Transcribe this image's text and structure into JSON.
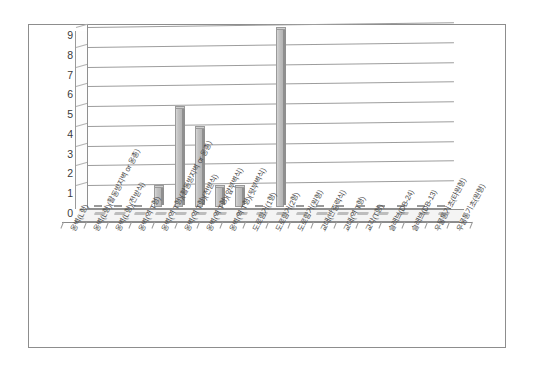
{
  "chart_data": {
    "type": "bar",
    "title": "",
    "xlabel": "",
    "ylabel": "",
    "ylim": [
      0,
      9
    ],
    "ytick_step": 1,
    "grid": true,
    "legend": "none",
    "style": "3d-column",
    "yticks": [
      "9",
      "8",
      "7",
      "6",
      "5",
      "4",
      "3",
      "2",
      "1",
      "0"
    ],
    "categories": [
      "옹벽(L형)",
      "옹벽(L형)(활동방지벽 or 옹총)",
      "옹벽(L형)(전받식)",
      "옹벽(역 T형)",
      "옹벽(역 T형)(활동방지벽 or 옹총)",
      "옹벽(역 T형)(전받식)",
      "옹벽(역 T형)(앞부벽식)",
      "옹벽(역 T형)(뒷부벽식)",
      "도로함거(1형)",
      "도로함거(2형)",
      "도로함거(원형)",
      "교대(반중력식)",
      "교대(역 T형)",
      "교각(T형)",
      "슬래브(DB-24)",
      "슬래브(DB-13)",
      "우물통기초(타원형)",
      "우물통기초(원형)"
    ],
    "values": [
      0,
      0,
      0,
      1,
      5,
      4,
      1,
      1,
      0,
      9,
      0,
      0,
      0,
      0,
      0,
      0,
      0,
      0
    ],
    "bar_color": "#bdbdbd",
    "bar_edge_color": "#9a9a9a",
    "plot_bg": "#ffffff",
    "grid_color": "#9d9d9d",
    "frame_color": "#8d8d8d"
  }
}
